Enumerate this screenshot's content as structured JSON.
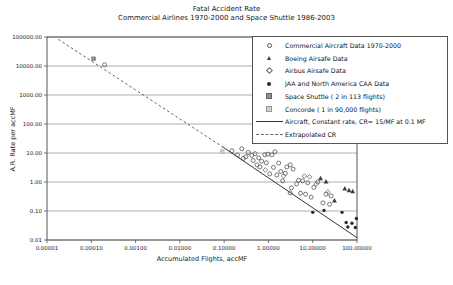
{
  "chart_data": {
    "type": "scatter",
    "title": "Fatal Accident Rate",
    "subtitle": "Commercial Airlines 1970-2000 and Space Shuttle 1986-2003",
    "xlabel": "Accumulated Flights, accMF",
    "ylabel": "A.R. Rate per accMF",
    "x_scale": "log",
    "y_scale": "log",
    "xlim": [
      1e-05,
      100
    ],
    "ylim": [
      0.01,
      100000
    ],
    "grid": "horizontal",
    "legend_position": "top-right",
    "x_ticks": [
      {
        "value": 1e-05,
        "label": "0.00001"
      },
      {
        "value": 0.0001,
        "label": "0.00010"
      },
      {
        "value": 0.001,
        "label": "0.00100"
      },
      {
        "value": 0.01,
        "label": "0.01000"
      },
      {
        "value": 0.1,
        "label": "0.10000"
      },
      {
        "value": 1,
        "label": "1.00000"
      },
      {
        "value": 10,
        "label": "10.00000"
      },
      {
        "value": 100,
        "label": "100.00000"
      }
    ],
    "y_ticks": [
      {
        "value": 100000,
        "label": "100000.00"
      },
      {
        "value": 10000,
        "label": "10000.00"
      },
      {
        "value": 1000,
        "label": "1000.00"
      },
      {
        "value": 100,
        "label": "100.00"
      },
      {
        "value": 10,
        "label": "10.00"
      },
      {
        "value": 1,
        "label": "1.00"
      },
      {
        "value": 0.1,
        "label": "0.10"
      },
      {
        "value": 0.01,
        "label": "0.01"
      }
    ],
    "colors": {
      "background": "#ffffff",
      "axis": "#555555",
      "grid": "#9a9a9a",
      "text": "#222222",
      "line": "#333333",
      "dashed_line": "#666666",
      "marker_stroke": "#555555",
      "marker_dark": "#3d3d3d",
      "marker_fill_dark": "#2a2a2a",
      "marker_mid": "#8f8f8f",
      "marker_light": "#cfcfcf"
    },
    "series": [
      {
        "id": "commercial",
        "name": "Commercial Aircraft Data 1970-2000",
        "marker": "open-circle",
        "points": [
          [
            0.0002,
            11000
          ],
          [
            0.15,
            12
          ],
          [
            0.2,
            8.5
          ],
          [
            0.25,
            14
          ],
          [
            0.27,
            6.5
          ],
          [
            0.31,
            7.4
          ],
          [
            0.35,
            10.5
          ],
          [
            0.42,
            8.3
          ],
          [
            0.45,
            5.5
          ],
          [
            0.5,
            9.5
          ],
          [
            0.55,
            3.9
          ],
          [
            0.6,
            6.8
          ],
          [
            0.64,
            3.3
          ],
          [
            0.7,
            5.2
          ],
          [
            0.83,
            8.7
          ],
          [
            0.9,
            4.6
          ],
          [
            0.97,
            9.1
          ],
          [
            1.07,
            1.9
          ],
          [
            1.2,
            8.7
          ],
          [
            1.3,
            3.2
          ],
          [
            1.4,
            11
          ],
          [
            1.55,
            1.75
          ],
          [
            1.7,
            4.5
          ],
          [
            1.9,
            2.3
          ],
          [
            2.1,
            1.1
          ],
          [
            2.4,
            2.0
          ],
          [
            2.6,
            3.3
          ],
          [
            3.1,
            3.9
          ],
          [
            3.1,
            0.42
          ],
          [
            3.3,
            0.63
          ],
          [
            3.6,
            2.8
          ],
          [
            4.3,
            0.86
          ],
          [
            4.8,
            1.15
          ],
          [
            5.3,
            0.41
          ],
          [
            5.9,
            1.1
          ],
          [
            6.9,
            0.38
          ],
          [
            7.7,
            0.95
          ],
          [
            9.2,
            0.3
          ],
          [
            10.6,
            0.65
          ],
          [
            13,
            1.0
          ],
          [
            17,
            0.19
          ],
          [
            20,
            0.38
          ],
          [
            24,
            0.17
          ],
          [
            26,
            0.33
          ]
        ]
      },
      {
        "id": "boeing",
        "name": "Boeing Airsafe Data",
        "marker": "filled-triangle",
        "points": [
          [
            15,
            1.35
          ],
          [
            20,
            1.05
          ],
          [
            31,
            0.23
          ],
          [
            53,
            0.6
          ],
          [
            66,
            0.52
          ],
          [
            80,
            0.48
          ]
        ]
      },
      {
        "id": "airbus",
        "name": "Airbus Airsafe Data",
        "marker": "open-diamond",
        "points": [
          [
            0.85,
            2.6
          ],
          [
            2.2,
            1.6
          ],
          [
            6.5,
            1.6
          ],
          [
            8.5,
            1.5
          ],
          [
            12,
            0.85
          ],
          [
            22,
            0.45
          ]
        ]
      },
      {
        "id": "jaa-caa",
        "name": "JAA and North America CAA Data",
        "marker": "filled-circle",
        "points": [
          [
            10,
            0.09
          ],
          [
            18,
            0.105
          ],
          [
            46,
            0.09
          ],
          [
            57,
            0.04
          ],
          [
            62,
            0.028
          ],
          [
            77,
            0.038
          ],
          [
            92,
            0.027
          ],
          [
            97,
            0.055
          ]
        ]
      },
      {
        "id": "space-shuttle",
        "name": "Space Shuttle ( 2 in 113 flights)",
        "marker": "small-square-dark",
        "points": [
          [
            0.000113,
            17699
          ]
        ]
      },
      {
        "id": "concorde",
        "name": "Concorde ( 1 in 90,000 flights)",
        "marker": "small-square-light",
        "points": [
          [
            0.09,
            11.1
          ]
        ]
      },
      {
        "id": "constant-rate",
        "name": "Aircraft, Constant rate, CR= 15/MF at 0.1 MF",
        "type": "line",
        "style": "solid",
        "points": [
          [
            0.09,
            16.7
          ],
          [
            100,
            0.012
          ]
        ]
      },
      {
        "id": "extrapolated-cr",
        "name": "Extrapolated CR",
        "type": "line",
        "style": "dashed",
        "points": [
          [
            1.8e-05,
            83000
          ],
          [
            0.3,
            5
          ]
        ]
      }
    ]
  }
}
